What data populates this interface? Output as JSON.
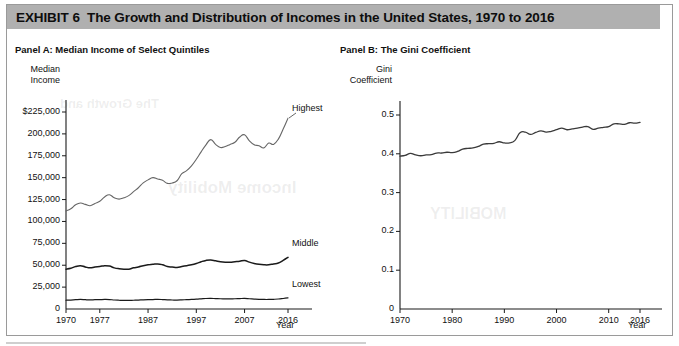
{
  "exhibit": {
    "label": "EXHIBIT",
    "number": "6",
    "title": "The Growth and Distribution of Incomes in the United States, 1970 to 2016"
  },
  "panel_a": {
    "title": "Panel A: Median Income of Select Quintiles",
    "y_axis_name_line1": "Median",
    "y_axis_name_line2": "Income",
    "x_axis_name": "Year",
    "y_ticks": [
      "$225,000",
      "200,000",
      "175,000",
      "150,000",
      "125,000",
      "100,000",
      "75,000",
      "50,000",
      "25,000",
      "0"
    ],
    "x_ticks": [
      "1970",
      "1977",
      "1987",
      "1997",
      "2007",
      "2016"
    ],
    "series_labels": {
      "highest": "Highest",
      "middle": "Middle",
      "lowest": "Lowest"
    }
  },
  "panel_b": {
    "title": "Panel B: The Gini Coefficient",
    "y_axis_name_line1": "Gini",
    "y_axis_name_line2": "Coefficient",
    "x_axis_name": "Year",
    "y_ticks": [
      "0.5",
      "0.4",
      "0.3",
      "0.2",
      "0.1",
      "0"
    ],
    "x_ticks": [
      "1970",
      "1980",
      "1990",
      "2000",
      "2010",
      "2016"
    ]
  },
  "ghost_text": {
    "line1": "Income Mobility",
    "line2": "The Growth and",
    "line3": "MOBILITY"
  },
  "colors": {
    "header_bar": "#b0b0b0",
    "frame_border": "#9a9a9a",
    "axis": "#1a1a1a",
    "highest_line": "#666666",
    "middle_line": "#1a1a1a",
    "lowest_line": "#1a1a1a",
    "gini_line": "#3a3a3a",
    "text": "#111111"
  },
  "chart_data": [
    {
      "type": "line",
      "title": "Panel A: Median Income of Select Quintiles",
      "xlabel": "Year",
      "ylabel": "Median Income",
      "xlim": [
        1970,
        2016
      ],
      "ylim": [
        0,
        225000
      ],
      "grid": false,
      "legend": "inline-right-of-line",
      "x": [
        1970,
        1971,
        1972,
        1973,
        1974,
        1975,
        1976,
        1977,
        1978,
        1979,
        1980,
        1981,
        1982,
        1983,
        1984,
        1985,
        1986,
        1987,
        1988,
        1989,
        1990,
        1991,
        1992,
        1993,
        1994,
        1995,
        1996,
        1997,
        1998,
        1999,
        2000,
        2001,
        2002,
        2003,
        2004,
        2005,
        2006,
        2007,
        2008,
        2009,
        2010,
        2011,
        2012,
        2013,
        2014,
        2015,
        2016
      ],
      "series": [
        {
          "name": "Highest",
          "values": [
            112000,
            114500,
            119000,
            121000,
            119500,
            118000,
            120500,
            123000,
            128000,
            130500,
            127000,
            125500,
            127000,
            129500,
            134000,
            138500,
            144000,
            147500,
            150000,
            148500,
            147000,
            143500,
            144000,
            146500,
            154500,
            158000,
            163500,
            171000,
            179500,
            187500,
            193500,
            188000,
            184500,
            185500,
            188000,
            190500,
            196500,
            199000,
            192000,
            187500,
            186500,
            184000,
            189500,
            188000,
            194000,
            205500,
            218000
          ]
        },
        {
          "name": "Middle",
          "values": [
            45500,
            46500,
            48500,
            49500,
            48000,
            47000,
            48000,
            48500,
            49500,
            49000,
            47000,
            46000,
            45500,
            45500,
            47000,
            48000,
            49500,
            50500,
            51000,
            51500,
            50500,
            48500,
            48000,
            47500,
            48500,
            49500,
            50500,
            52000,
            54000,
            55500,
            56000,
            55000,
            54000,
            53500,
            53500,
            54000,
            54500,
            55500,
            53500,
            52000,
            51000,
            50500,
            50500,
            51500,
            52500,
            55500,
            59000
          ]
        },
        {
          "name": "Lowest",
          "values": [
            10000,
            10200,
            10600,
            10900,
            10600,
            10400,
            10600,
            10700,
            10900,
            10800,
            10300,
            10000,
            9800,
            9800,
            10000,
            10200,
            10500,
            10700,
            10800,
            11000,
            10800,
            10400,
            10300,
            10200,
            10400,
            10700,
            10900,
            11200,
            11600,
            12000,
            12100,
            11900,
            11700,
            11600,
            11600,
            11700,
            11900,
            12100,
            11700,
            11300,
            11000,
            10900,
            10900,
            11100,
            11400,
            12000,
            12700
          ]
        }
      ]
    },
    {
      "type": "line",
      "title": "Panel B: The Gini Coefficient",
      "xlabel": "Year",
      "ylabel": "Gini Coefficient",
      "xlim": [
        1970,
        2016
      ],
      "ylim": [
        0,
        0.5
      ],
      "grid": false,
      "x": [
        1970,
        1971,
        1972,
        1973,
        1974,
        1975,
        1976,
        1977,
        1978,
        1979,
        1980,
        1981,
        1982,
        1983,
        1984,
        1985,
        1986,
        1987,
        1988,
        1989,
        1990,
        1991,
        1992,
        1993,
        1994,
        1995,
        1996,
        1997,
        1998,
        1999,
        2000,
        2001,
        2002,
        2003,
        2004,
        2005,
        2006,
        2007,
        2008,
        2009,
        2010,
        2011,
        2012,
        2013,
        2014,
        2015,
        2016
      ],
      "series": [
        {
          "name": "Gini Coefficient",
          "values": [
            0.394,
            0.396,
            0.401,
            0.397,
            0.395,
            0.397,
            0.398,
            0.402,
            0.402,
            0.404,
            0.403,
            0.406,
            0.412,
            0.414,
            0.415,
            0.419,
            0.425,
            0.426,
            0.427,
            0.431,
            0.428,
            0.428,
            0.434,
            0.454,
            0.456,
            0.45,
            0.455,
            0.459,
            0.456,
            0.458,
            0.462,
            0.466,
            0.462,
            0.464,
            0.466,
            0.469,
            0.47,
            0.463,
            0.466,
            0.468,
            0.47,
            0.477,
            0.477,
            0.476,
            0.48,
            0.479,
            0.481
          ]
        }
      ]
    }
  ]
}
